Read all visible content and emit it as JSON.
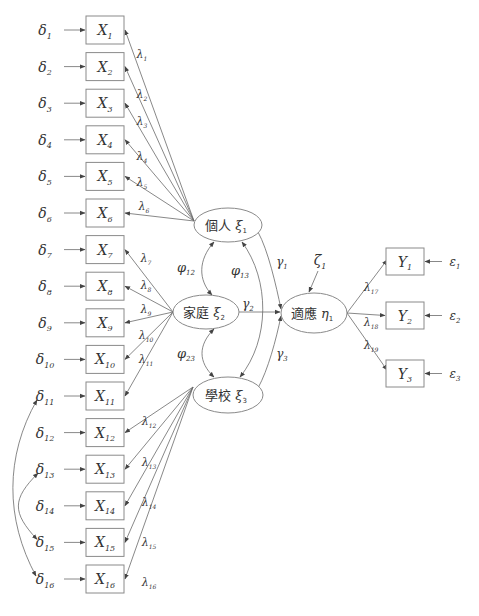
{
  "diagram": {
    "title": "",
    "colors": {
      "stroke": "#8a8a8a",
      "line": "#6a6a6a",
      "text": "#333333",
      "background": "#ffffff"
    },
    "indicators_x": [
      {
        "id": "X1",
        "label": "X",
        "sub": "1",
        "error": "δ",
        "error_sub": "1"
      },
      {
        "id": "X2",
        "label": "X",
        "sub": "2",
        "error": "δ",
        "error_sub": "2"
      },
      {
        "id": "X3",
        "label": "X",
        "sub": "3",
        "error": "δ",
        "error_sub": "3"
      },
      {
        "id": "X4",
        "label": "X",
        "sub": "4",
        "error": "δ",
        "error_sub": "4"
      },
      {
        "id": "X5",
        "label": "X",
        "sub": "5",
        "error": "δ",
        "error_sub": "5"
      },
      {
        "id": "X6",
        "label": "X",
        "sub": "6",
        "error": "δ",
        "error_sub": "6"
      },
      {
        "id": "X7",
        "label": "X",
        "sub": "7",
        "error": "δ",
        "error_sub": "7"
      },
      {
        "id": "X8",
        "label": "X",
        "sub": "8",
        "error": "δ",
        "error_sub": "8"
      },
      {
        "id": "X9",
        "label": "X",
        "sub": "9",
        "error": "δ",
        "error_sub": "9"
      },
      {
        "id": "X10",
        "label": "X",
        "sub": "10",
        "error": "δ",
        "error_sub": "10"
      },
      {
        "id": "X11",
        "label": "X",
        "sub": "11",
        "error": "δ",
        "error_sub": "11"
      },
      {
        "id": "X12",
        "label": "X",
        "sub": "12",
        "error": "δ",
        "error_sub": "12"
      },
      {
        "id": "X13",
        "label": "X",
        "sub": "13",
        "error": "δ",
        "error_sub": "13"
      },
      {
        "id": "X14",
        "label": "X",
        "sub": "14",
        "error": "δ",
        "error_sub": "14"
      },
      {
        "id": "X15",
        "label": "X",
        "sub": "15",
        "error": "δ",
        "error_sub": "15"
      },
      {
        "id": "X16",
        "label": "X",
        "sub": "16",
        "error": "δ",
        "error_sub": "16"
      }
    ],
    "loadings_x": [
      {
        "label": "λ",
        "sub": "1"
      },
      {
        "label": "λ",
        "sub": "2"
      },
      {
        "label": "λ",
        "sub": "3"
      },
      {
        "label": "λ",
        "sub": "4"
      },
      {
        "label": "λ",
        "sub": "5"
      },
      {
        "label": "λ",
        "sub": "6"
      },
      {
        "label": "λ",
        "sub": "7"
      },
      {
        "label": "λ",
        "sub": "8"
      },
      {
        "label": "λ",
        "sub": "9"
      },
      {
        "label": "λ",
        "sub": "10"
      },
      {
        "label": "λ",
        "sub": "11"
      },
      {
        "label": "λ",
        "sub": "12"
      },
      {
        "label": "λ",
        "sub": "13"
      },
      {
        "label": "λ",
        "sub": "14"
      },
      {
        "label": "λ",
        "sub": "15"
      },
      {
        "label": "λ",
        "sub": "16"
      }
    ],
    "latent_exogenous": [
      {
        "id": "xi1",
        "name": "個人",
        "symbol": "ξ",
        "sub": "1",
        "indicators": [
          1,
          6
        ]
      },
      {
        "id": "xi2",
        "name": "家庭",
        "symbol": "ξ",
        "sub": "2",
        "indicators": [
          7,
          11
        ]
      },
      {
        "id": "xi3",
        "name": "學校",
        "symbol": "ξ",
        "sub": "3",
        "indicators": [
          12,
          16
        ]
      }
    ],
    "latent_endogenous": {
      "id": "eta1",
      "name": "適應",
      "symbol": "η",
      "sub": "1",
      "disturbance": "ζ",
      "disturbance_sub": "1"
    },
    "covariances": [
      {
        "label": "φ",
        "sub": "12",
        "from": "xi1",
        "to": "xi2"
      },
      {
        "label": "φ",
        "sub": "13",
        "from": "xi1",
        "to": "xi3"
      },
      {
        "label": "φ",
        "sub": "23",
        "from": "xi2",
        "to": "xi3"
      }
    ],
    "paths": [
      {
        "label": "γ",
        "sub": "1",
        "from": "xi1",
        "to": "eta1"
      },
      {
        "label": "γ",
        "sub": "2",
        "from": "xi2",
        "to": "eta1"
      },
      {
        "label": "γ",
        "sub": "3",
        "from": "xi3",
        "to": "eta1"
      }
    ],
    "indicators_y": [
      {
        "id": "Y1",
        "label": "Y",
        "sub": "1",
        "error": "ε",
        "error_sub": "1",
        "loading": "λ",
        "loading_sub": "17"
      },
      {
        "id": "Y2",
        "label": "Y",
        "sub": "2",
        "error": "ε",
        "error_sub": "2",
        "loading": "λ",
        "loading_sub": "18"
      },
      {
        "id": "Y3",
        "label": "Y",
        "sub": "3",
        "error": "ε",
        "error_sub": "3",
        "loading": "λ",
        "loading_sub": "19"
      }
    ],
    "error_covariances": [
      {
        "from": "δ11",
        "to": "δ16"
      },
      {
        "from": "δ13",
        "to": "δ15"
      }
    ]
  }
}
